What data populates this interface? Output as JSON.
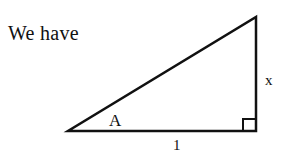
{
  "intro_text": "We have",
  "triangle": {
    "vertices": {
      "left": [
        68,
        131
      ],
      "right": [
        256,
        131
      ],
      "top": [
        256,
        17
      ]
    },
    "right_angle_at": "right",
    "angle_label": "A",
    "vertical_side_label": "x",
    "base_label": "1",
    "stroke_color": "#111111"
  }
}
